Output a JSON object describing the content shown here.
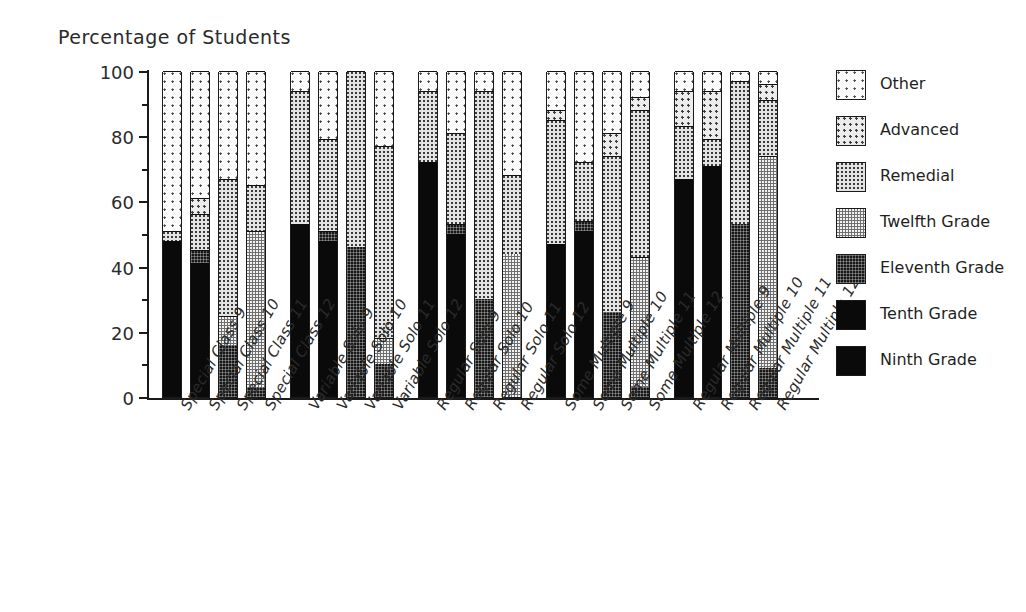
{
  "chart_data": {
    "type": "bar",
    "subtype": "stacked-bar-100",
    "title": "Percentage of Students",
    "xlabel": "",
    "ylabel": "Percentage of Students",
    "ylim": [
      0,
      100
    ],
    "yticks": [
      0,
      20,
      40,
      60,
      80,
      100
    ],
    "ytick_labels": [
      "0",
      "20",
      "40",
      "60",
      "80",
      "100"
    ],
    "yminor_ticks": [
      10,
      30,
      50,
      70,
      90
    ],
    "grid": false,
    "legend_position": "right",
    "legend": [
      "Other",
      "Advanced",
      "Remedial",
      "Twelfth Grade",
      "Eleventh Grade",
      "Tenth Grade",
      "Ninth Grade"
    ],
    "stack_order_bottom_to_top": [
      "Ninth Grade",
      "Tenth Grade",
      "Eleventh Grade",
      "Twelfth Grade",
      "Remedial",
      "Advanced",
      "Other"
    ],
    "categories": [
      "Special Class 9",
      "Special Class 10",
      "Special Class 11",
      "Special Class 12",
      "Variable Solo 9",
      "Variable Solo 10",
      "Variable Solo 11",
      "Variable Solo 12",
      "Regular Solo 9",
      "Regular Solo 10",
      "Regular Solo 11",
      "Regular Solo 12",
      "Some Multiple 9",
      "Some Multiple 10",
      "Some Multiple 11",
      "Some Multiple 12",
      "Regular Multiple 9",
      "Regular Multiple 10",
      "Regular Multiple 11",
      "Regular Multiple 12"
    ],
    "groups": [
      {
        "name": "Special Class",
        "bars": [
          {
            "label": "Special Class 9",
            "grade": "9",
            "values": {
              "Ninth Grade": 48,
              "Tenth Grade": 0,
              "Eleventh Grade": 0,
              "Twelfth Grade": 0,
              "Remedial": 3,
              "Advanced": 0,
              "Other": 49
            }
          },
          {
            "label": "Special Class 10",
            "grade": "10",
            "values": {
              "Ninth Grade": 0,
              "Tenth Grade": 41,
              "Eleventh Grade": 4,
              "Twelfth Grade": 0,
              "Remedial": 11,
              "Advanced": 5,
              "Other": 39
            }
          },
          {
            "label": "Special Class 11",
            "grade": "11",
            "values": {
              "Ninth Grade": 0,
              "Tenth Grade": 0,
              "Eleventh Grade": 16,
              "Twelfth Grade": 9,
              "Remedial": 42,
              "Advanced": 0,
              "Other": 33
            }
          },
          {
            "label": "Special Class 12",
            "grade": "12",
            "values": {
              "Ninth Grade": 0,
              "Tenth Grade": 0,
              "Eleventh Grade": 3,
              "Twelfth Grade": 48,
              "Remedial": 14,
              "Advanced": 0,
              "Other": 35
            }
          }
        ]
      },
      {
        "name": "Variable Solo",
        "bars": [
          {
            "label": "Variable Solo 9",
            "grade": "9",
            "values": {
              "Ninth Grade": 53,
              "Tenth Grade": 0,
              "Eleventh Grade": 0,
              "Twelfth Grade": 0,
              "Remedial": 41,
              "Advanced": 0,
              "Other": 6
            }
          },
          {
            "label": "Variable Solo 10",
            "grade": "10",
            "values": {
              "Ninth Grade": 0,
              "Tenth Grade": 48,
              "Eleventh Grade": 3,
              "Twelfth Grade": 0,
              "Remedial": 28,
              "Advanced": 0,
              "Other": 21
            }
          },
          {
            "label": "Variable Solo 11",
            "grade": "11",
            "values": {
              "Ninth Grade": 0,
              "Tenth Grade": 0,
              "Eleventh Grade": 46,
              "Twelfth Grade": 0,
              "Remedial": 54,
              "Advanced": 0,
              "Other": 0
            }
          },
          {
            "label": "Variable Solo 12",
            "grade": "12",
            "values": {
              "Ninth Grade": 0,
              "Tenth Grade": 0,
              "Eleventh Grade": 10,
              "Twelfth Grade": 8,
              "Remedial": 59,
              "Advanced": 0,
              "Other": 23
            }
          }
        ]
      },
      {
        "name": "Regular Solo",
        "bars": [
          {
            "label": "Regular Solo 9",
            "grade": "9",
            "values": {
              "Ninth Grade": 72,
              "Tenth Grade": 0,
              "Eleventh Grade": 0,
              "Twelfth Grade": 0,
              "Remedial": 22,
              "Advanced": 0,
              "Other": 6
            }
          },
          {
            "label": "Regular Solo 10",
            "grade": "10",
            "values": {
              "Ninth Grade": 0,
              "Tenth Grade": 50,
              "Eleventh Grade": 3,
              "Twelfth Grade": 0,
              "Remedial": 28,
              "Advanced": 0,
              "Other": 19
            }
          },
          {
            "label": "Regular Solo 11",
            "grade": "11",
            "values": {
              "Ninth Grade": 0,
              "Tenth Grade": 0,
              "Eleventh Grade": 30,
              "Twelfth Grade": 0,
              "Remedial": 64,
              "Advanced": 0,
              "Other": 6
            }
          },
          {
            "label": "Regular Solo 12",
            "grade": "12",
            "values": {
              "Ninth Grade": 0,
              "Tenth Grade": 0,
              "Eleventh Grade": 0,
              "Twelfth Grade": 44,
              "Remedial": 24,
              "Advanced": 0,
              "Other": 32
            }
          }
        ]
      },
      {
        "name": "Some Multiple",
        "bars": [
          {
            "label": "Some Multiple 9",
            "grade": "9",
            "values": {
              "Ninth Grade": 47,
              "Tenth Grade": 0,
              "Eleventh Grade": 0,
              "Twelfth Grade": 0,
              "Remedial": 38,
              "Advanced": 3,
              "Other": 12
            }
          },
          {
            "label": "Some Multiple 10",
            "grade": "10",
            "values": {
              "Ninth Grade": 0,
              "Tenth Grade": 51,
              "Eleventh Grade": 3,
              "Twelfth Grade": 0,
              "Remedial": 18,
              "Advanced": 0,
              "Other": 28
            }
          },
          {
            "label": "Some Multiple 11",
            "grade": "11",
            "values": {
              "Ninth Grade": 0,
              "Tenth Grade": 0,
              "Eleventh Grade": 26,
              "Twelfth Grade": 0,
              "Remedial": 48,
              "Advanced": 7,
              "Other": 19
            }
          },
          {
            "label": "Some Multiple 12",
            "grade": "12",
            "values": {
              "Ninth Grade": 0,
              "Tenth Grade": 0,
              "Eleventh Grade": 3,
              "Twelfth Grade": 40,
              "Remedial": 45,
              "Advanced": 4,
              "Other": 8
            }
          }
        ]
      },
      {
        "name": "Regular Multiple",
        "bars": [
          {
            "label": "Regular Multiple 9",
            "grade": "9",
            "values": {
              "Ninth Grade": 67,
              "Tenth Grade": 0,
              "Eleventh Grade": 0,
              "Twelfth Grade": 0,
              "Remedial": 16,
              "Advanced": 11,
              "Other": 6
            }
          },
          {
            "label": "Regular Multiple 10",
            "grade": "10",
            "values": {
              "Ninth Grade": 0,
              "Tenth Grade": 71,
              "Eleventh Grade": 0,
              "Twelfth Grade": 0,
              "Remedial": 8,
              "Advanced": 15,
              "Other": 6
            }
          },
          {
            "label": "Regular Multiple 11",
            "grade": "11",
            "values": {
              "Ninth Grade": 0,
              "Tenth Grade": 0,
              "Eleventh Grade": 53,
              "Twelfth Grade": 0,
              "Remedial": 44,
              "Advanced": 0,
              "Other": 3
            }
          },
          {
            "label": "Regular Multiple 12",
            "grade": "12",
            "values": {
              "Ninth Grade": 0,
              "Tenth Grade": 0,
              "Eleventh Grade": 9,
              "Twelfth Grade": 65,
              "Remedial": 17,
              "Advanced": 5,
              "Other": 4
            }
          }
        ]
      }
    ],
    "colors": {
      "Ninth Grade": "#0a0a0a",
      "Tenth Grade": "#0a0a0a",
      "Eleventh Grade": "#171717",
      "Twelfth Grade": "#6f6f6f",
      "Remedial": "#e3e3e3",
      "Advanced": "#ececec",
      "Other": "#fbfbfb",
      "axis": "#1a1a1a",
      "text": "#2b2b2b",
      "background": "#ffffff"
    }
  },
  "legend_items": [
    {
      "label": "Other",
      "key": "Other"
    },
    {
      "label": "Advanced",
      "key": "Advanced"
    },
    {
      "label": "Remedial",
      "key": "Remedial"
    },
    {
      "label": "Twelfth Grade",
      "key": "Twelfth Grade"
    },
    {
      "label": "Eleventh Grade",
      "key": "Eleventh Grade"
    },
    {
      "label": "Tenth Grade",
      "key": "Tenth Grade"
    },
    {
      "label": "Ninth Grade",
      "key": "Ninth Grade"
    }
  ]
}
